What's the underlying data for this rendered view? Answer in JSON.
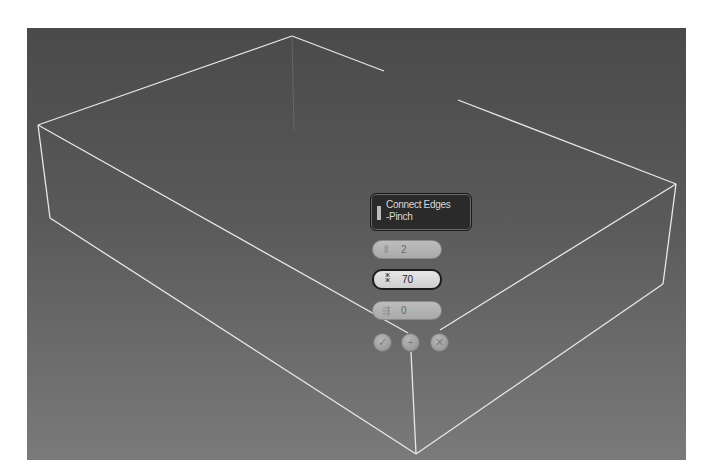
{
  "viewport": {
    "background_top": "#4a4a4a",
    "background_bottom": "#7a7a7a",
    "wire_color": "#e8e8e8"
  },
  "caddy": {
    "title_line1": "Connect Edges",
    "title_line2": "-Pinch",
    "fields": [
      {
        "name": "segments",
        "icon": "segments-icon",
        "value": "2"
      },
      {
        "name": "pinch",
        "icon": "pinch-icon",
        "value": "70"
      },
      {
        "name": "slide",
        "icon": "slide-icon",
        "value": "0"
      }
    ],
    "buttons": [
      {
        "name": "ok",
        "icon": "checkmark-icon",
        "glyph": "✓"
      },
      {
        "name": "apply-and-continue",
        "icon": "plus-icon",
        "glyph": "+"
      },
      {
        "name": "cancel",
        "icon": "close-icon",
        "glyph": "✕"
      }
    ]
  },
  "box": {
    "vertices": {
      "top_back": [
        292,
        36
      ],
      "top_left": [
        38,
        125
      ],
      "top_right": [
        676,
        184
      ],
      "top_front": [
        408,
        333
      ],
      "bottom_left": [
        50,
        218
      ],
      "bottom_right": [
        663,
        284
      ],
      "bottom_front": [
        416,
        454
      ]
    }
  }
}
